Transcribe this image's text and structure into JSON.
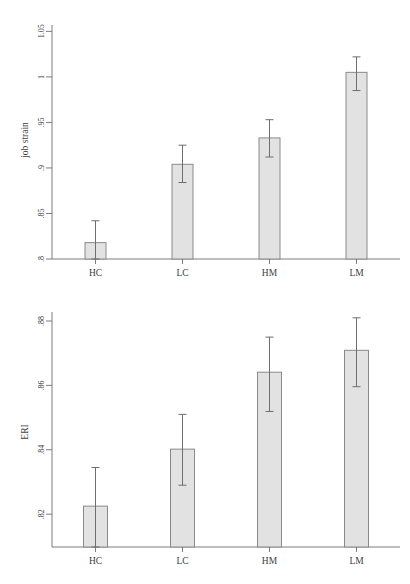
{
  "page": {
    "background_color": "#ffffff",
    "width": 410,
    "height": 584
  },
  "style": {
    "bar_fill": "#e2e2e2",
    "bar_stroke": "#8a8a8a",
    "axis_color": "#6e6e6e",
    "text_color": "#3d3d3d"
  },
  "chart_data": [
    {
      "id": "job-strain",
      "type": "bar",
      "title": "",
      "xlabel": "",
      "ylabel": "job strain",
      "categories": [
        "HC",
        "LC",
        "HM",
        "LM"
      ],
      "values": [
        0.818,
        0.904,
        0.933,
        1.005
      ],
      "error_low": [
        0.8,
        0.884,
        0.912,
        0.985
      ],
      "error_high": [
        0.842,
        0.925,
        0.953,
        1.022
      ],
      "ylim": [
        0.8,
        1.057
      ],
      "yticks": [
        0.8,
        0.85,
        0.9,
        0.95,
        1,
        1.05
      ],
      "ytick_labels": [
        ".8",
        ".85",
        ".9",
        ".95",
        "1",
        "1.05"
      ],
      "grid": false,
      "legend": "none"
    },
    {
      "id": "eri",
      "type": "bar",
      "title": "",
      "xlabel": "",
      "ylabel": "ERI",
      "categories": [
        "HC",
        "LC",
        "HM",
        "LM"
      ],
      "values": [
        0.8225,
        0.8402,
        0.8641,
        0.8709
      ],
      "error_low": [
        0.8098,
        0.829,
        0.8519,
        0.8596
      ],
      "error_high": [
        0.8345,
        0.851,
        0.875,
        0.881
      ],
      "ylim": [
        0.8098,
        0.8828
      ],
      "yticks": [
        0.82,
        0.84,
        0.86,
        0.88
      ],
      "ytick_labels": [
        ".82",
        ".84",
        ".86",
        ".88"
      ],
      "grid": false,
      "legend": "none"
    }
  ]
}
